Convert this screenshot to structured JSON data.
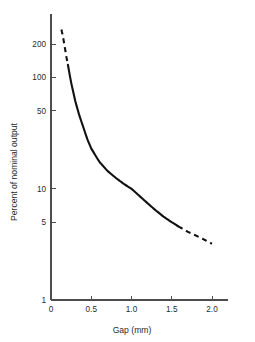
{
  "chart_data": {
    "type": "line",
    "title": "",
    "subtitle": "",
    "xlabel": "Gap (mm)",
    "ylabel": "Percent of nominal output",
    "xlim": [
      0,
      2.2
    ],
    "ylim": [
      1,
      300
    ],
    "yscale": "log",
    "xscale": "linear",
    "grid": false,
    "legend": null,
    "xticks": [
      0,
      0.5,
      1.0,
      1.5,
      2.0
    ],
    "xticklabels": [
      "0",
      "0.5",
      "1.0",
      "1.5",
      "2.0"
    ],
    "yticks": [
      1,
      5,
      10,
      50,
      100,
      200
    ],
    "yticklabels": [
      "1",
      "5",
      "10",
      "50",
      "100",
      "200"
    ],
    "series": [
      {
        "name": "Output vs gap",
        "style": "solid-with-dashed-extrapolation",
        "color": "#111111",
        "x": [
          0.13,
          0.15,
          0.17,
          0.19,
          0.21,
          0.25,
          0.3,
          0.35,
          0.4,
          0.45,
          0.5,
          0.6,
          0.7,
          0.8,
          0.9,
          1.0,
          1.1,
          1.2,
          1.3,
          1.4,
          1.5,
          1.58,
          1.7,
          1.8,
          1.9,
          2.0
        ],
        "y": [
          270,
          230,
          190,
          155,
          130,
          90,
          62,
          46,
          36,
          28,
          23,
          17.5,
          14.5,
          12.6,
          11.1,
          10.0,
          8.6,
          7.4,
          6.4,
          5.6,
          5.0,
          4.6,
          4.1,
          3.8,
          3.5,
          3.2
        ],
        "segments": [
          {
            "kind": "dashed",
            "x_from": 0.13,
            "x_to": 0.21
          },
          {
            "kind": "solid",
            "x_from": 0.21,
            "x_to": 1.58
          },
          {
            "kind": "dashed",
            "x_from": 1.58,
            "x_to": 2.0
          }
        ]
      }
    ]
  },
  "axes": {
    "x_title": "Gap (mm)",
    "y_title": "Percent of nominal output"
  }
}
